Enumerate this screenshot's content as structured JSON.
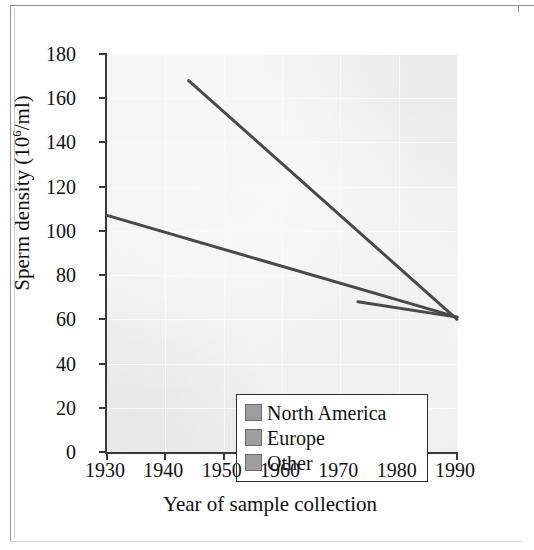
{
  "figure": {
    "y_axis_title_prefix": "Sperm density (10",
    "y_axis_title_exponent": "6",
    "y_axis_title_suffix": "/ml)",
    "x_axis_title": "Year of sample collection"
  },
  "legend": {
    "items": [
      {
        "label": "North America",
        "swatch_color": "#9e9e9e"
      },
      {
        "label": "Europe",
        "swatch_color": "#9e9e9e"
      },
      {
        "label": "Other",
        "swatch_color": "#9e9e9e"
      }
    ]
  },
  "chart_data": {
    "type": "line",
    "title": "",
    "xlabel": "Year of sample collection",
    "ylabel": "Sperm density (10^6/ml)",
    "xlim": [
      1930,
      1990
    ],
    "ylim": [
      0,
      180
    ],
    "xticks": [
      1930,
      1940,
      1950,
      1960,
      1970,
      1980,
      1990
    ],
    "yticks": [
      0,
      20,
      40,
      60,
      80,
      100,
      120,
      140,
      160,
      180
    ],
    "grid": true,
    "legend_position": "lower-left-inside",
    "line_color": "#4a4a4a",
    "plot_background": "#ebebeb",
    "series": [
      {
        "name": "North America",
        "points": [
          {
            "x": 1944,
            "y": 168
          },
          {
            "x": 1990,
            "y": 60
          }
        ]
      },
      {
        "name": "Europe",
        "points": [
          {
            "x": 1930,
            "y": 107
          },
          {
            "x": 1990,
            "y": 61
          }
        ]
      },
      {
        "name": "Other",
        "points": [
          {
            "x": 1973,
            "y": 68
          },
          {
            "x": 1990,
            "y": 61
          }
        ]
      }
    ]
  }
}
